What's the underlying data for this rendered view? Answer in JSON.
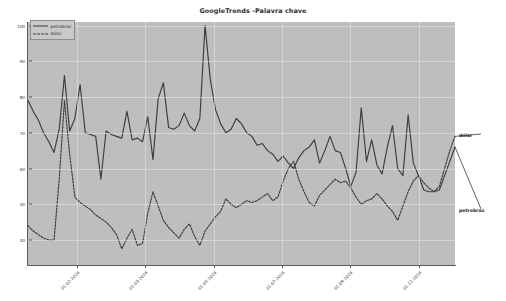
{
  "chart_data": {
    "type": "line",
    "title": "GoogleTrends -Palavra chave",
    "xlabel": "",
    "ylabel": "",
    "ylim": [
      33,
      101
    ],
    "yticks": [
      40,
      50,
      60,
      70,
      80,
      90,
      100
    ],
    "ytick_labels": [
      "40",
      "50",
      "60",
      "70",
      "80",
      "90",
      "100"
    ],
    "grid": true,
    "legend_position": "upper-left",
    "xtick_labels": [
      "01-02-2019",
      "01-03-2019",
      "01-05-2019",
      "01-07-2019",
      "01-09-2019",
      "01-11-2019"
    ],
    "xtick_positions": [
      0.115,
      0.275,
      0.435,
      0.595,
      0.755,
      0.915
    ],
    "series": [
      {
        "name": "petrobras",
        "style": "solid",
        "color": "#3c3c3c",
        "annotation": "petrobras",
        "values": [
          79.0,
          76.0,
          73.5,
          70.0,
          67.5,
          64.5,
          71.0,
          86.0,
          70.5,
          74.0,
          83.5,
          70.0,
          69.5,
          69.0,
          57.0,
          70.5,
          69.5,
          69.0,
          68.5,
          76.0,
          68.0,
          68.5,
          67.5,
          74.5,
          62.5,
          79.5,
          84.0,
          71.5,
          71.0,
          72.0,
          75.5,
          72.0,
          70.5,
          74.0,
          100.0,
          85.0,
          76.5,
          72.5,
          70.0,
          71.0,
          74.0,
          72.5,
          70.0,
          69.0,
          66.5,
          67.0,
          65.0,
          64.0,
          62.0,
          63.5,
          61.5,
          60.0,
          63.0,
          65.0,
          66.0,
          68.0,
          61.5,
          65.0,
          69.0,
          65.0,
          64.5,
          60.0,
          55.0,
          59.0,
          77.0,
          62.0,
          68.0,
          61.0,
          58.5,
          66.0,
          72.0,
          60.0,
          58.0,
          75.0,
          61.5,
          58.0,
          54.0,
          53.5,
          53.5,
          54.0,
          58.0,
          62.0,
          66.0
        ]
      },
      {
        "name": "dólar",
        "style": "dashed",
        "color": "#3c3c3c",
        "annotation": "dólar",
        "values": [
          44.0,
          42.5,
          41.5,
          40.5,
          40.0,
          40.0,
          57.0,
          79.0,
          64.0,
          52.0,
          50.5,
          49.5,
          48.5,
          47.0,
          46.0,
          45.0,
          43.5,
          41.5,
          37.5,
          40.5,
          43.0,
          38.5,
          39.0,
          47.5,
          53.5,
          49.5,
          45.5,
          43.5,
          42.0,
          40.5,
          43.0,
          44.5,
          41.0,
          38.5,
          42.5,
          44.5,
          46.5,
          48.0,
          51.5,
          50.0,
          49.0,
          50.0,
          51.0,
          50.5,
          51.0,
          52.0,
          53.0,
          51.0,
          52.0,
          56.5,
          60.0,
          62.0,
          57.0,
          53.5,
          50.5,
          49.5,
          52.5,
          54.0,
          55.5,
          57.0,
          56.0,
          56.5,
          54.5,
          52.0,
          50.0,
          51.0,
          51.5,
          53.0,
          51.5,
          49.5,
          48.0,
          45.5,
          49.5,
          53.5,
          56.5,
          58.0,
          56.0,
          54.5,
          53.5,
          55.0,
          60.0,
          65.0,
          69.0
        ]
      }
    ]
  },
  "legend": {
    "items": [
      {
        "label": "petrobras",
        "style": "solid"
      },
      {
        "label": "dólar",
        "style": "dashed"
      }
    ]
  }
}
